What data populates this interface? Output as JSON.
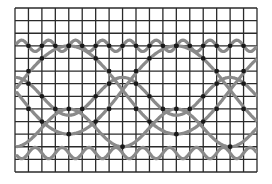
{
  "diagram": {
    "type": "waveform-grid",
    "width": 272,
    "height": 184,
    "grid": {
      "x0": 15,
      "x1": 257,
      "y0": 8,
      "y1": 172,
      "columns": 18,
      "rows": 13,
      "line_color": "#2a2a2a"
    },
    "trace_color": "#8a8a8a",
    "dot_color": "#1a1a1a",
    "traces": [
      {
        "name": "top-ripple",
        "center_row": 3,
        "amplitude": 0.45,
        "period_cols": 2,
        "phase": 0.0
      },
      {
        "name": "upper-wave",
        "center_row": 7,
        "amplitude": 1.5,
        "period_cols": 8,
        "phase": 0.25
      },
      {
        "name": "mid-wave-a",
        "center_row": 6.5,
        "amplitude": 3.5,
        "period_cols": 16,
        "phase": 0.0
      },
      {
        "name": "mid-wave-b",
        "center_row": 6.5,
        "amplitude": 3.5,
        "period_cols": 16,
        "phase": 0.5
      },
      {
        "name": "lower-wave",
        "center_row": 9.5,
        "amplitude": 1.5,
        "period_cols": 8,
        "phase": 0.75
      },
      {
        "name": "bottom-ripple",
        "center_row": 11.5,
        "amplitude": 0.45,
        "period_cols": 2,
        "phase": 0.5
      }
    ]
  }
}
